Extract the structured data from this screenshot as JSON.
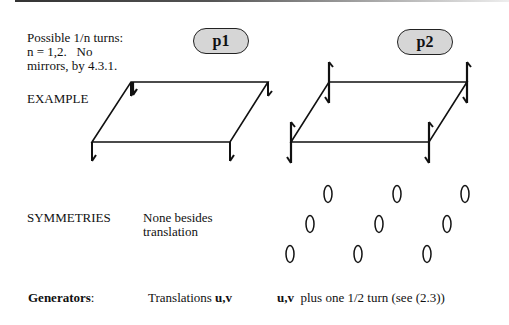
{
  "intro": {
    "line1": "Possible 1/n turns:",
    "line2": "n = 1,2.   No",
    "line3": "mirrors, by 4.3.1."
  },
  "groups": [
    {
      "name": "p1"
    },
    {
      "name": "p2"
    }
  ],
  "rows": {
    "example_label": "EXAMPLE",
    "symmetries_label": "SYMMETRIES",
    "generators_label": "Generators",
    "generators_colon": ":"
  },
  "p1": {
    "symmetries_line1": "None besides",
    "symmetries_line2": "translation",
    "generators_prefix": "Translations ",
    "generators_bold": "u,v"
  },
  "p2": {
    "generators_bold": "u,v",
    "generators_rest": "  plus one 1/2 turn (see (2.3))",
    "ellipse_rows": 3,
    "ellipse_cols": 3
  },
  "colors": {
    "ink": "#111111",
    "pill_fill": "#d6d6d6"
  }
}
